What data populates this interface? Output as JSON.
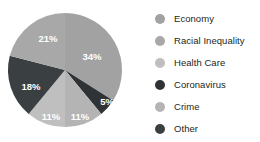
{
  "chart_data": {
    "type": "pie",
    "title": "",
    "subtitle": "",
    "xlabel": "",
    "ylabel": "",
    "grid": false,
    "legend_position": "right",
    "label_format": "percent",
    "start_angle_deg": 0,
    "direction": "clockwise",
    "categories": [
      "Economy",
      "Racial Inequality",
      "Health Care",
      "Coronavirus",
      "Crime",
      "Other"
    ],
    "values": [
      34,
      21,
      11,
      5,
      11,
      18
    ],
    "total": 100,
    "slices": [
      {
        "label": "Economy",
        "value": 34,
        "display": "34%",
        "color": "#a2a2a2",
        "order_clockwise": 1,
        "label_x": 92,
        "label_y": 56
      },
      {
        "label": "Coronavirus",
        "value": 5,
        "display": "5%",
        "color": "#2f3336",
        "order_clockwise": 2,
        "label_x": 107,
        "label_y": 101
      },
      {
        "label": "Crime",
        "value": 11,
        "display": "11%",
        "color": "#b4b4b4",
        "order_clockwise": 3,
        "label_x": 80,
        "label_y": 116
      },
      {
        "label": "Health Care",
        "value": 11,
        "display": "11%",
        "color": "#bfbfbf",
        "order_clockwise": 4,
        "label_x": 51,
        "label_y": 116
      },
      {
        "label": "Other",
        "value": 18,
        "display": "18%",
        "color": "#3a3f42",
        "order_clockwise": 5,
        "label_x": 31,
        "label_y": 86
      },
      {
        "label": "Racial Inequality",
        "value": 21,
        "display": "21%",
        "color": "#a8a8a8",
        "order_clockwise": 6,
        "label_x": 48,
        "label_y": 38
      }
    ]
  },
  "legend": {
    "items": [
      {
        "label": "Economy",
        "color": "#a2a2a2"
      },
      {
        "label": "Racial Inequality",
        "color": "#a8a8a8"
      },
      {
        "label": "Health Care",
        "color": "#bfbfbf"
      },
      {
        "label": "Coronavirus",
        "color": "#2f3336"
      },
      {
        "label": "Crime",
        "color": "#b4b4b4"
      },
      {
        "label": "Other",
        "color": "#3a3f42"
      }
    ]
  },
  "colors": {
    "background": "#ffffff",
    "label_text": "#ffffff",
    "legend_text": "#231f20"
  }
}
